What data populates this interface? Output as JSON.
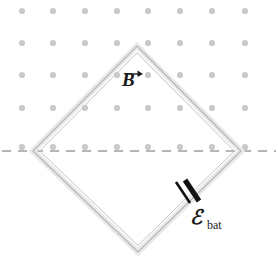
{
  "figure": {
    "background_color": "#ffffff",
    "width": 278,
    "height": 269
  },
  "field": {
    "name": "magnetic-field-dots",
    "symbol_meaning": "field out of page",
    "dot_color": "#c9c9c9",
    "dot_radius": 3.1,
    "columns": 8,
    "rows": 5,
    "x_start": 22,
    "y_start": 11,
    "x_spacing": 31.6,
    "y_spacing": 32.4,
    "row_y": [
      11,
      43,
      75,
      108,
      147
    ],
    "col_x": [
      22,
      53,
      85,
      117,
      148,
      180,
      212,
      245
    ]
  },
  "loop": {
    "name": "square-wire-loop",
    "shape": "diamond",
    "wire_color": "#b9b9b9",
    "wire_inner_color": "#e8e8e8",
    "vertices": {
      "top": [
        137,
        46
      ],
      "right": [
        241,
        151
      ],
      "bottom": [
        138,
        252
      ],
      "left": [
        33,
        151
      ]
    }
  },
  "axis": {
    "name": "dashed-horizontal-line",
    "color": "#6e6e6e",
    "y": 151,
    "x_start": 2,
    "x_end": 276,
    "dash": "9 7"
  },
  "battery": {
    "name": "battery-symbol",
    "color": "#111111",
    "long_plate": {
      "x1": 176,
      "y1": 182,
      "x2": 190,
      "y2": 203,
      "width": 2.6
    },
    "short_plate": {
      "x1": 185,
      "y1": 180,
      "x2": 199,
      "y2": 201,
      "width": 5.2
    },
    "label": "ℰ",
    "subscript": "bat"
  },
  "b_field_label": {
    "name": "magnetic-field-label",
    "text": "B",
    "arrow": "vector-arrow-right"
  }
}
